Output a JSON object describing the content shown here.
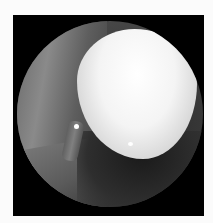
{
  "image": {
    "description": "Circular endoscopic view showing a bright white rounded mass with surrounding grey tissue on a black background",
    "colors": {
      "background": "#fbfbfb",
      "frame": "#000000",
      "mass_highlight": "#ffffff",
      "tissue": "#6a6a6a"
    }
  }
}
